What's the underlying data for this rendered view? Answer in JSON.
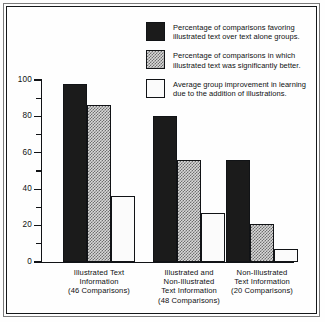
{
  "chart_data": {
    "type": "bar",
    "title": "",
    "subtitle": "",
    "xlabel": "",
    "ylabel": "",
    "ylim": [
      0,
      100
    ],
    "grid": false,
    "legend_position": "top-right",
    "categories": [
      "Illustrated Text Information (46 Comparisons)",
      "Illustrated and Non-Illustrated Text Information (48 Comparisons)",
      "Non-Illustrated Text Information (20 Comparisons)"
    ],
    "series": [
      {
        "name": "Percentage of comparisons favoring illustrated text over text alone groups.",
        "values": [
          98,
          80,
          56
        ],
        "fill": "solid-black",
        "color": "#1b1b1b"
      },
      {
        "name": "Percentage of comparisons in which illustrated text was significantly better.",
        "values": [
          86,
          56,
          21
        ],
        "fill": "checker-gray",
        "color": "#d8d8d8"
      },
      {
        "name": "Average group improvement in learning due to the addition of illustrations.",
        "values": [
          36,
          27,
          7
        ],
        "fill": "sparse-dots",
        "color": "#fbfbfb"
      }
    ],
    "y_major_ticks": [
      0,
      20,
      40,
      60,
      80,
      100
    ],
    "y_minor_ticks": [
      10,
      30,
      50,
      70,
      90
    ],
    "y_tick_labels": [
      "0",
      "20",
      "40",
      "60",
      "80",
      "100"
    ]
  },
  "legend": {
    "items": [
      {
        "swatch": "solid-black-swatch",
        "line1": "Percentage of comparisons favoring",
        "line2": "illustrated text over text alone groups."
      },
      {
        "swatch": "checker-gray-swatch",
        "line1": "Percentage of comparisons in which",
        "line2": "illustrated text was significantly better."
      },
      {
        "swatch": "sparse-dots-swatch",
        "line1": "Average group improvement in learning",
        "line2": "due to the addition of illustrations."
      }
    ]
  },
  "x_axis": {
    "categories": [
      {
        "line1": "Illustrated Text",
        "line2": "Information",
        "line3": "(46 Comparisons)",
        "line4": ""
      },
      {
        "line1": "Illustrated and",
        "line2": "Non-Illustrated",
        "line3": "Text Information",
        "line4": "(48 Comparisons)"
      },
      {
        "line1": "Non-Illustrated",
        "line2": "Text Information",
        "line3": "(20 Comparisons)",
        "line4": ""
      }
    ]
  },
  "y_axis": {
    "labels": [
      "100",
      "80",
      "60",
      "40",
      "20",
      "0"
    ]
  }
}
